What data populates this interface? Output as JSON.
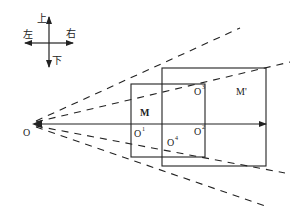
{
  "compass": {
    "up": "上",
    "down": "下",
    "left": "左",
    "right": "右"
  },
  "labels": {
    "origin": "O",
    "small_rect": "M",
    "large_rect": "M'",
    "o1": "O",
    "o1_sup": "1",
    "o2": "O",
    "o2_sup": "2",
    "o3": "O",
    "o3_sup": "3",
    "o4": "O",
    "o4_sup": "4"
  },
  "colors": {
    "line": "#222222",
    "background": "#ffffff"
  }
}
